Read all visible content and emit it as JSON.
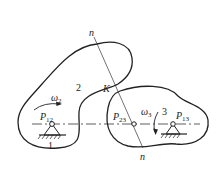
{
  "diagram": {
    "type": "cam-mechanism-instant-centers",
    "labels": {
      "normal_top": "n",
      "normal_bottom": "n",
      "contact_point": "K",
      "body_2": "2",
      "body_3": "3",
      "ground": "1",
      "omega_2": "ω",
      "omega_2_sub": "2",
      "omega_3": "ω",
      "omega_3_sub": "3",
      "p12": "P",
      "p12_sub": "12",
      "p23": "P",
      "p23_sub": "23",
      "p13": "P",
      "p13_sub": "13"
    },
    "colors": {
      "stroke": "#222222",
      "background": "#ffffff"
    }
  }
}
